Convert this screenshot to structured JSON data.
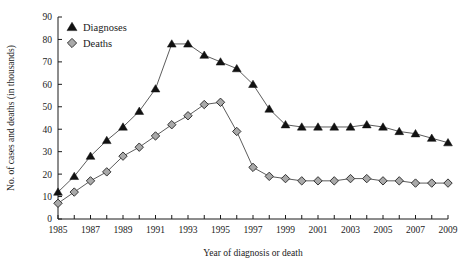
{
  "chart_data": {
    "type": "line",
    "title": "",
    "xlabel": "Year of diagnosis or death",
    "ylabel": "No. of cases and deaths (in thousands)",
    "xlim": [
      1985,
      2009
    ],
    "ylim": [
      0,
      90
    ],
    "ytick_step": 10,
    "yticks": [
      0,
      10,
      20,
      30,
      40,
      50,
      60,
      70,
      80,
      90
    ],
    "ytick_labels": [
      "0",
      "10",
      "20",
      "30",
      "40",
      "50",
      "60",
      "70",
      "80",
      "90"
    ],
    "x": [
      1985,
      1986,
      1987,
      1988,
      1989,
      1990,
      1991,
      1992,
      1993,
      1994,
      1995,
      1996,
      1997,
      1998,
      1999,
      2000,
      2001,
      2002,
      2003,
      2004,
      2005,
      2006,
      2007,
      2008,
      2009
    ],
    "xticks": [
      1985,
      1986,
      1987,
      1988,
      1989,
      1990,
      1991,
      1992,
      1993,
      1994,
      1995,
      1996,
      1997,
      1998,
      1999,
      2000,
      2001,
      2002,
      2003,
      2004,
      2005,
      2006,
      2007,
      2008,
      2009
    ],
    "xtick_labels": [
      "1985",
      "",
      "1987",
      "",
      "1989",
      "",
      "1991",
      "",
      "1993",
      "",
      "1995",
      "",
      "1997",
      "",
      "1999",
      "",
      "2001",
      "",
      "2003",
      "",
      "2005",
      "",
      "2007",
      "",
      "2009"
    ],
    "grid": false,
    "legend_position": "top-left",
    "series": [
      {
        "name": "Diagnoses",
        "marker": "triangle",
        "color": "#111111",
        "values": [
          12,
          19,
          28,
          35,
          41,
          48,
          58,
          78,
          78,
          73,
          70,
          67,
          60,
          49,
          42,
          41,
          41,
          41,
          41,
          42,
          41,
          39,
          38,
          36,
          34
        ]
      },
      {
        "name": "Deaths",
        "marker": "diamond",
        "color": "#a9a9a9",
        "values": [
          7,
          12,
          17,
          21,
          28,
          32,
          37,
          42,
          46,
          51,
          52,
          39,
          23,
          19,
          18,
          17,
          17,
          17,
          18,
          18,
          17,
          17,
          16,
          16,
          16
        ]
      }
    ]
  },
  "legend": {
    "entries": [
      {
        "label": "Diagnoses",
        "marker": "triangle-icon"
      },
      {
        "label": "Deaths",
        "marker": "diamond-icon"
      }
    ]
  }
}
